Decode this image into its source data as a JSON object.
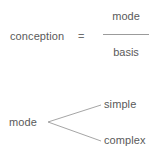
{
  "figure": {
    "background_color": "#ffffff",
    "text_color": "#5a5a5a",
    "line_color": "#9b9b9b"
  },
  "equation": {
    "lhs": "conception",
    "operator": "=",
    "fraction": {
      "numerator": "mode",
      "denominator": "basis"
    }
  },
  "tree": {
    "root": "mode",
    "children": [
      {
        "label": "simple"
      },
      {
        "label": "complex"
      }
    ]
  }
}
